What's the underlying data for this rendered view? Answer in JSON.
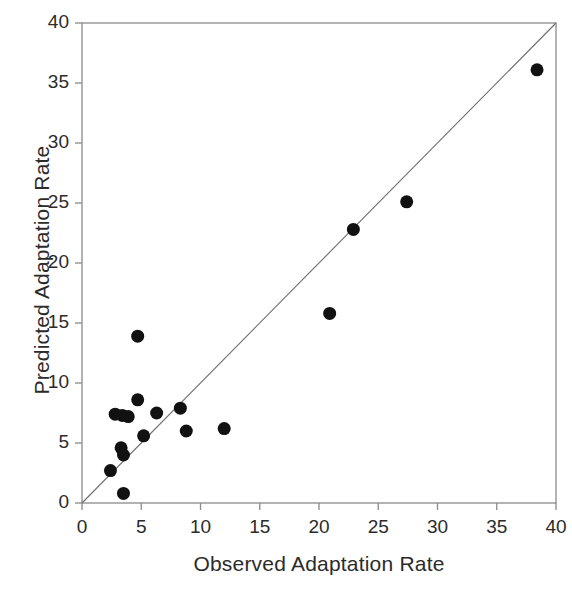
{
  "chart_data": {
    "type": "scatter",
    "title": "",
    "xlabel": "Observed Adaptation Rate",
    "ylabel": "Predicted Adaptation Rate",
    "xlim": [
      0,
      40
    ],
    "ylim": [
      0,
      40
    ],
    "xticks": [
      "0",
      "5",
      "10",
      "15",
      "20",
      "25",
      "30",
      "35",
      "40"
    ],
    "yticks": [
      "0",
      "5",
      "10",
      "15",
      "20",
      "25",
      "30",
      "35",
      "40"
    ],
    "xtick_values": [
      0,
      5,
      10,
      15,
      20,
      25,
      30,
      35,
      40
    ],
    "ytick_values": [
      0,
      5,
      10,
      15,
      20,
      25,
      30,
      35,
      40
    ],
    "grid": false,
    "legend": "none",
    "marker": "filled-circle",
    "marker_color": "#111111",
    "marker_size_px": 13,
    "axis_color": "#8a8a8a",
    "reference_line": {
      "label": "1:1 line",
      "from": [
        0,
        0
      ],
      "to": [
        40,
        40
      ],
      "color": "#6e6e6e"
    },
    "points": [
      {
        "x": 2.4,
        "y": 2.7
      },
      {
        "x": 2.8,
        "y": 7.4
      },
      {
        "x": 3.3,
        "y": 4.6
      },
      {
        "x": 3.4,
        "y": 7.3
      },
      {
        "x": 3.5,
        "y": 0.8
      },
      {
        "x": 3.5,
        "y": 4.0
      },
      {
        "x": 3.9,
        "y": 7.2
      },
      {
        "x": 4.7,
        "y": 13.9
      },
      {
        "x": 4.7,
        "y": 8.6
      },
      {
        "x": 5.2,
        "y": 5.6
      },
      {
        "x": 6.3,
        "y": 7.5
      },
      {
        "x": 8.3,
        "y": 7.9
      },
      {
        "x": 8.8,
        "y": 6.0
      },
      {
        "x": 12.0,
        "y": 6.2
      },
      {
        "x": 20.9,
        "y": 15.8
      },
      {
        "x": 22.9,
        "y": 22.8
      },
      {
        "x": 27.4,
        "y": 25.1
      },
      {
        "x": 38.4,
        "y": 36.1
      }
    ]
  }
}
